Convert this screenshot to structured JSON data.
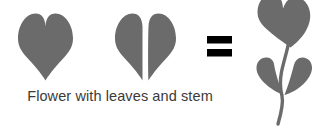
{
  "figure": {
    "title": "Flower with leaves and stem",
    "background_color": "#ffffff",
    "shape_color": "#6b6b6b",
    "operator_color": "#000000",
    "caption_color": "#3a3a3a",
    "equation_reading": "heart plus split heart equals flower with leaves and stem",
    "operator_label": "=",
    "terms": [
      {
        "name": "whole-heart",
        "label": "Heart",
        "role": "flower-head-source"
      },
      {
        "name": "split-heart",
        "label": "Split heart",
        "role": "leaves-source",
        "parts": [
          "left-half-heart",
          "right-half-heart"
        ]
      },
      {
        "name": "flower-result",
        "label": "Flower with leaves and stem",
        "role": "result",
        "parts": [
          "flower-head-heart",
          "left-leaf",
          "right-leaf",
          "stem"
        ]
      }
    ]
  },
  "caption": {
    "text": "Flower with leaves and stem"
  }
}
